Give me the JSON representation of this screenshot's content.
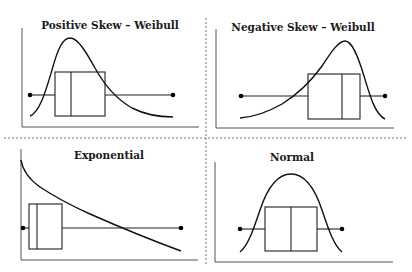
{
  "figure": {
    "panels": [
      {
        "id": "positive-skew",
        "title": "Positive Skew – Weibull"
      },
      {
        "id": "negative-skew",
        "title": "Negative Skew – Weibull"
      },
      {
        "id": "exponential",
        "title": "Exponential"
      },
      {
        "id": "normal",
        "title": "Normal"
      }
    ],
    "colors": {
      "line": "#111111",
      "axis": "#555555",
      "divider": "#777777",
      "background": "#ffffff"
    }
  }
}
